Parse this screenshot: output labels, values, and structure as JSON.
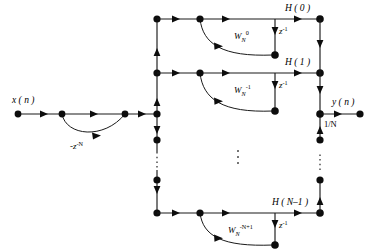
{
  "diagram": {
    "type": "signal-flow-graph",
    "input": {
      "label": "x ( n )",
      "name": "input-signal"
    },
    "output": {
      "label": "y ( n )",
      "name": "output-signal",
      "gain_label": "1/N"
    },
    "comb": {
      "coefficient_label": "-z",
      "coefficient_exponent": "-N",
      "full_label": "-z⁻ᴺ"
    },
    "resonators": [
      {
        "index": 0,
        "output_label": "H ( 0 )",
        "coefficient_base": "W",
        "coefficient_sub": "N",
        "coefficient_sup": "0",
        "delay_base": "z",
        "delay_sup": "-1"
      },
      {
        "index": 1,
        "output_label": "H ( 1 )",
        "coefficient_base": "W",
        "coefficient_sub": "N",
        "coefficient_sup": "-1",
        "delay_base": "z",
        "delay_sup": "-1"
      },
      {
        "index": "N-1",
        "output_label": "H ( N–1 )",
        "coefficient_base": "W",
        "coefficient_sub": "N",
        "coefficient_sup": "-N+1",
        "delay_base": "z",
        "delay_sup": "-1"
      }
    ],
    "ellipsis": {
      "label": "⋮",
      "name": "vertical-ellipsis"
    },
    "colors": {
      "line": "#1a1a1a",
      "node": "#0d0d0d",
      "background": "#ffffff"
    }
  }
}
